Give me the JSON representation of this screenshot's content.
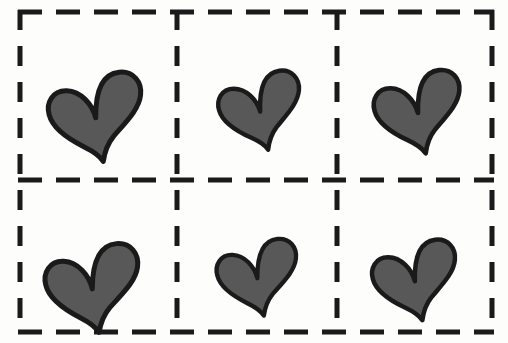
{
  "image": {
    "title": "Dashed grid of six hearts",
    "width": 508,
    "height": 343,
    "background_color": "#fdfdfc",
    "style": "hand-drawn marker sketch"
  },
  "grid": {
    "name": "dashed-grid",
    "rows": 2,
    "columns": 3,
    "cell_count": 6,
    "line_style": "dashed",
    "line_color": "#1a1a1a",
    "line_width": 5,
    "dash_horizontal": "24 14",
    "dash_vertical": "20 16",
    "bounds": {
      "x": 20,
      "y": 12,
      "width": 472,
      "height": 320
    },
    "vertical_dividers_x": [
      177,
      337
    ],
    "horizontal_dividers_y": [
      180
    ]
  },
  "shape": {
    "name": "heart",
    "count": 6,
    "fill_color": "#585858",
    "outline_color": "#1a1a1a",
    "outline_width": 5
  },
  "cells": [
    {
      "id": "cell-r1c1",
      "row": 1,
      "column": 1,
      "label": "heart-1",
      "cx": 93,
      "cy": 92,
      "scale": 1.0,
      "rotate": -6
    },
    {
      "id": "cell-r1c2",
      "row": 1,
      "column": 2,
      "label": "heart-2",
      "cx": 257,
      "cy": 89,
      "scale": 0.88,
      "rotate": -8
    },
    {
      "id": "cell-r1c3",
      "row": 1,
      "column": 3,
      "label": "heart-3",
      "cx": 415,
      "cy": 89,
      "scale": 0.93,
      "rotate": -7
    },
    {
      "id": "cell-r2c1",
      "row": 2,
      "column": 1,
      "label": "heart-4",
      "cx": 90,
      "cy": 263,
      "scale": 1.0,
      "rotate": -5
    },
    {
      "id": "cell-r2c2",
      "row": 2,
      "column": 2,
      "label": "heart-5",
      "cx": 255,
      "cy": 256,
      "scale": 0.86,
      "rotate": -6
    },
    {
      "id": "cell-r2c3",
      "row": 2,
      "column": 3,
      "label": "heart-6",
      "cx": 412,
      "cy": 258,
      "scale": 0.9,
      "rotate": -7
    }
  ]
}
